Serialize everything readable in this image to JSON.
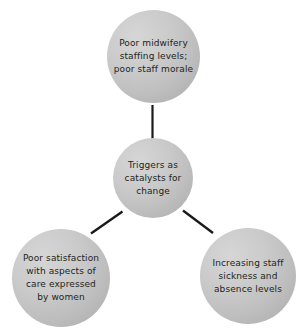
{
  "diagram": {
    "type": "hub-and-spoke",
    "title": "Triggers as catalysts for change",
    "background_color": "#ffffff",
    "node_fill_color": "#c4c4c4",
    "connector_color": "#1a1a1a",
    "text_color": "#231f20",
    "center": {
      "id": "center",
      "label": "Triggers as\ncatalysts for\nchange"
    },
    "spokes": [
      {
        "id": "top",
        "label": "Poor midwifery\nstaffing levels;\npoor staff morale",
        "position": "top"
      },
      {
        "id": "bottom-left",
        "label": "Poor satisfaction\nwith aspects of\ncare expressed\nby women",
        "position": "bottom-left"
      },
      {
        "id": "bottom-right",
        "label": "Increasing staff\nsickness and\nabsence levels",
        "position": "bottom-right"
      }
    ],
    "connectors": [
      {
        "id": "center-to-top",
        "from": "center",
        "to": "top"
      },
      {
        "id": "center-to-bottom-left",
        "from": "center",
        "to": "bottom-left"
      },
      {
        "id": "center-to-bottom-right",
        "from": "center",
        "to": "bottom-right"
      }
    ]
  }
}
